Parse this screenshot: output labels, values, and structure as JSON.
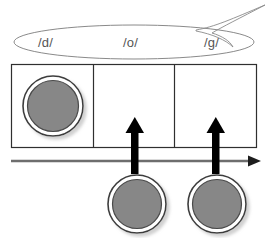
{
  "diagram": {
    "speech_bubble": {
      "name": "speech-bubble",
      "shape": "ellipse-with-tail",
      "tail_direction": "upper-right",
      "outline_color": "#888888",
      "fill_color": "#ffffff",
      "phonemes": [
        {
          "label": "/d/",
          "x": 48,
          "y": 42
        },
        {
          "label": "/o/",
          "x": 132,
          "y": 42
        },
        {
          "label": "/g/",
          "x": 213,
          "y": 42
        }
      ]
    },
    "elkonin_box": {
      "name": "elkonin-box",
      "outline_color": "#333333",
      "fill_color": "#ffffff",
      "x": 11,
      "y": 64,
      "width": 246,
      "height": 84,
      "cells": [
        {
          "name": "cell-1",
          "index": 1,
          "filled": true,
          "divider_x": 93
        },
        {
          "name": "cell-2",
          "index": 2,
          "filled": false,
          "divider_x": 174
        },
        {
          "name": "cell-3",
          "index": 3,
          "filled": false,
          "divider_x": null
        }
      ]
    },
    "timeline_arrow": {
      "name": "timeline-arrow",
      "color": "#6e6e6e",
      "x1": 11,
      "x2": 257,
      "y": 161,
      "direction": "right"
    },
    "move_arrows": [
      {
        "name": "move-arrow-1",
        "color": "#000000",
        "x": 135,
        "tip_y": 118,
        "base_y": 173
      },
      {
        "name": "move-arrow-2",
        "color": "#000000",
        "x": 216,
        "tip_y": 118,
        "base_y": 173
      }
    ],
    "counters": [
      {
        "name": "counter-in-cell-1",
        "cx": 53,
        "cy": 106,
        "r": 30,
        "position": "in-box",
        "fill": "#878787",
        "ring": "#ffffff",
        "edge": "#3d3d3d"
      },
      {
        "name": "counter-below-cell-2",
        "cx": 137,
        "cy": 204,
        "r": 29,
        "position": "below-line",
        "fill": "#878787",
        "ring": "#ffffff",
        "edge": "#3d3d3d"
      },
      {
        "name": "counter-below-cell-3",
        "cx": 217,
        "cy": 204,
        "r": 29,
        "position": "below-line",
        "fill": "#878787",
        "ring": "#ffffff",
        "edge": "#3d3d3d"
      }
    ],
    "colors": {
      "counter_fill": "#878787",
      "counter_ring": "#ffffff",
      "counter_edge": "#3d3d3d",
      "counter_shadow": "#9a9a9a",
      "box_stroke": "#333333",
      "bubble_stroke": "#888888",
      "timeline": "#6e6e6e",
      "arrow_black": "#000000",
      "text": "#555555",
      "background": "#ffffff"
    }
  }
}
